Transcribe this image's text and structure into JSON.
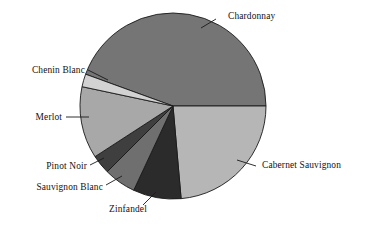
{
  "chart_data": {
    "type": "pie",
    "title": "",
    "subtitle": "",
    "xlabel": "",
    "ylabel": "",
    "legend_position": "none",
    "grid": false,
    "labels_position": "outside-with-leader-lines",
    "categories": [
      "Chardonnay",
      "Cabernet Sauvignon",
      "Zinfandel",
      "Sauvignon Blanc",
      "Pinot Noir",
      "Merlot",
      "Chenin Blanc"
    ],
    "values": [
      44.4,
      23.6,
      8.3,
      5.6,
      3.3,
      12.5,
      2.2
    ],
    "units": "percent",
    "slices": [
      {
        "label": "Chardonnay",
        "value": 44.4,
        "start_angle": 200,
        "end_angle": 360,
        "sweep": 160,
        "color": "#757575",
        "label_x": 228,
        "label_y": 19,
        "anchor": "start",
        "leader": "M 201,28 L 216,19"
      },
      {
        "label": "Cabernet Sauvignon",
        "value": 23.6,
        "start_angle": 0,
        "end_angle": 85,
        "sweep": 85,
        "color": "#b6b6b6",
        "label_x": 262,
        "label_y": 168,
        "anchor": "start",
        "leader": "M 237,160 L 256,166"
      },
      {
        "label": "Zinfandel",
        "value": 8.3,
        "start_angle": 85,
        "end_angle": 115,
        "sweep": 30,
        "color": "#2b2b2b",
        "label_x": 128,
        "label_y": 212,
        "anchor": "middle",
        "leader": "M 156,192 L 143,205"
      },
      {
        "label": "Sauvignon Blanc",
        "value": 5.6,
        "start_angle": 115,
        "end_angle": 135,
        "sweep": 20,
        "color": "#6f6f6f",
        "label_x": 103,
        "label_y": 190,
        "anchor": "end",
        "leader": "M 122,176 L 106,185"
      },
      {
        "label": "Pinot Noir",
        "value": 3.3,
        "start_angle": 135,
        "end_angle": 147,
        "sweep": 12,
        "color": "#3f3f3f",
        "label_x": 87,
        "label_y": 169,
        "anchor": "end",
        "leader": "M 104,158 L 90,165"
      },
      {
        "label": "Merlot",
        "value": 12.5,
        "start_angle": 147,
        "end_angle": 192,
        "sweep": 45,
        "color": "#a8a8a8",
        "label_x": 62,
        "label_y": 120,
        "anchor": "end",
        "leader": "M 89,117 L 66,117"
      },
      {
        "label": "Chenin Blanc",
        "value": 2.2,
        "start_angle": 192,
        "end_angle": 200,
        "sweep": 8,
        "color": "#d2d2d2",
        "label_x": 85,
        "label_y": 73,
        "anchor": "end",
        "leader": "M 108,80 L 88,70"
      }
    ],
    "geometry": {
      "center_x": 173,
      "center_y": 106,
      "radius": 93
    },
    "colors": {
      "background": "#ffffff",
      "outline": "#1a1a1a",
      "text": "#121212"
    }
  }
}
